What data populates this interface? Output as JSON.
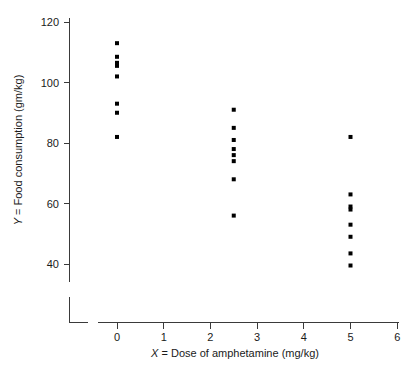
{
  "chart_data": {
    "type": "scatter",
    "title": "",
    "xlabel": "X = Dose of amphetamine (mg/kg)",
    "ylabel": "Y = Food consumption (gm/kg)",
    "xlabel_italic_prefix": "X",
    "xlabel_rest": " = Dose of amphetamine (mg/kg)",
    "ylabel_italic_prefix": "Y",
    "ylabel_rest": " = Food consumption (gm/kg)",
    "xlim": [
      0,
      6
    ],
    "ylim": [
      40,
      120
    ],
    "xticks": [
      0,
      1,
      2,
      3,
      4,
      5,
      6
    ],
    "xtick_labels": [
      "0",
      "1",
      "2",
      "3",
      "4",
      "5",
      "6"
    ],
    "yticks": [
      40,
      60,
      80,
      100,
      120
    ],
    "ytick_labels": [
      "40",
      "60",
      "80",
      "100",
      "120"
    ],
    "grid": false,
    "legend": "none",
    "axis_break": true,
    "marker": "square",
    "marker_color": "#000000",
    "marker_size_px": 4,
    "points": [
      {
        "x": 0,
        "y": 113
      },
      {
        "x": 0,
        "y": 108.5
      },
      {
        "x": 0,
        "y": 106.5
      },
      {
        "x": 0,
        "y": 105.5
      },
      {
        "x": 0,
        "y": 102
      },
      {
        "x": 0,
        "y": 93
      },
      {
        "x": 0,
        "y": 90
      },
      {
        "x": 0,
        "y": 82
      },
      {
        "x": 2.5,
        "y": 91
      },
      {
        "x": 2.5,
        "y": 85
      },
      {
        "x": 2.5,
        "y": 81
      },
      {
        "x": 2.5,
        "y": 78
      },
      {
        "x": 2.5,
        "y": 76
      },
      {
        "x": 2.5,
        "y": 74
      },
      {
        "x": 2.5,
        "y": 68
      },
      {
        "x": 2.5,
        "y": 56
      },
      {
        "x": 5,
        "y": 82
      },
      {
        "x": 5,
        "y": 63
      },
      {
        "x": 5,
        "y": 59
      },
      {
        "x": 5,
        "y": 58
      },
      {
        "x": 5,
        "y": 53
      },
      {
        "x": 5,
        "y": 49
      },
      {
        "x": 5,
        "y": 43.5
      },
      {
        "x": 5,
        "y": 39.5
      }
    ],
    "groups": [
      {
        "dose": 0,
        "count": 8,
        "values": [
          113,
          108.5,
          106.5,
          105.5,
          102,
          93,
          90,
          82
        ]
      },
      {
        "dose": 2.5,
        "count": 8,
        "values": [
          91,
          85,
          81,
          78,
          76,
          74,
          68,
          56
        ]
      },
      {
        "dose": 5,
        "count": 8,
        "values": [
          82,
          63,
          59,
          58,
          53,
          49,
          43.5,
          39.5
        ]
      }
    ]
  },
  "figure": {
    "background_color": "#ffffff",
    "axis_color": "#3a3a3a",
    "text_color": "#1a1a1a"
  }
}
